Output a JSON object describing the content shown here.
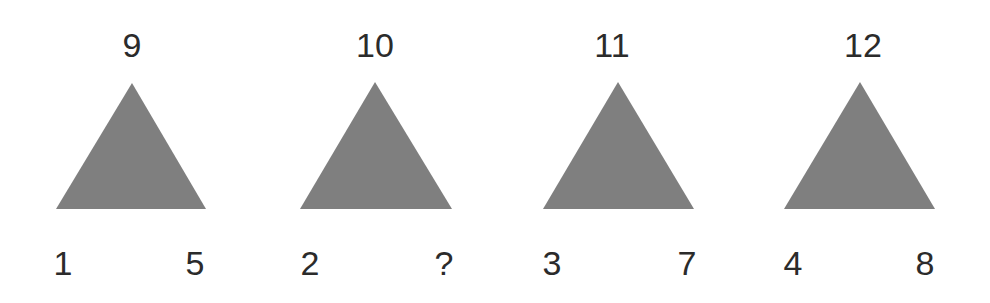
{
  "puzzle": {
    "triangle_color": "#7f7f7f",
    "text_color": "#2b2b2b",
    "triangles": [
      {
        "top": "9",
        "left": "1",
        "right": "5",
        "apex": [
          132,
          83
        ],
        "base_left": [
          56,
          209
        ],
        "base_right": [
          206,
          209
        ],
        "top_x": 132,
        "left_x": 63,
        "right_x": 195
      },
      {
        "top": "10",
        "left": "2",
        "right": "?",
        "apex": [
          375,
          82
        ],
        "base_left": [
          300,
          209
        ],
        "base_right": [
          452,
          209
        ],
        "top_x": 375,
        "left_x": 310,
        "right_x": 444
      },
      {
        "top": "11",
        "left": "3",
        "right": "7",
        "apex": [
          618,
          82
        ],
        "base_left": [
          543,
          209
        ],
        "base_right": [
          694,
          209
        ],
        "top_x": 612,
        "left_x": 552,
        "right_x": 687
      },
      {
        "top": "12",
        "left": "4",
        "right": "8",
        "apex": [
          860,
          82
        ],
        "base_left": [
          784,
          209
        ],
        "base_right": [
          935,
          209
        ],
        "top_x": 863,
        "left_x": 793,
        "right_x": 925
      }
    ]
  }
}
